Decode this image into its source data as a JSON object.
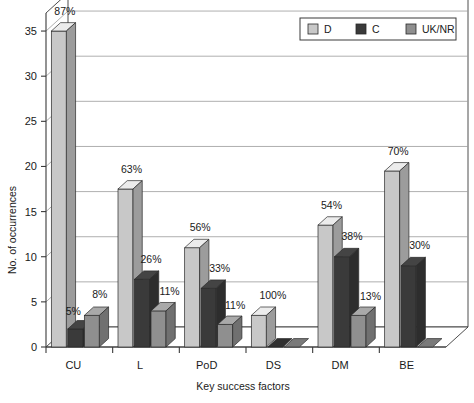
{
  "chart_data": {
    "type": "bar",
    "title": "",
    "subtitle": "",
    "xlabel": "Key success factors",
    "ylabel": "No. of occurrences",
    "categories": [
      "CU",
      "L",
      "PoD",
      "DS",
      "DM",
      "BE"
    ],
    "ylim": [
      0,
      37
    ],
    "yticks": [
      0,
      5,
      10,
      15,
      20,
      25,
      30,
      35
    ],
    "ytick_labels": [
      "0",
      "5",
      "10",
      "15",
      "20",
      "25",
      "30",
      "35"
    ],
    "grid": true,
    "grid_axis": "y",
    "legend_position": "top-right",
    "style": "3d-clustered-column",
    "series": [
      {
        "name": "D",
        "color": "#c8c8c8",
        "values": [
          35,
          17.5,
          11,
          3.5,
          13.5,
          19.5
        ],
        "labels": [
          "87%",
          "63%",
          "56%",
          "100%",
          "54%",
          "70%"
        ]
      },
      {
        "name": "C",
        "color": "#3a3a3a",
        "values": [
          2,
          7.5,
          6.5,
          0,
          10,
          9
        ],
        "labels": [
          "5%",
          "26%",
          "33%",
          "",
          "38%",
          "30%"
        ]
      },
      {
        "name": "UK/NR",
        "color": "#8f8f8f",
        "values": [
          3.5,
          4,
          2.5,
          0,
          3.5,
          0
        ],
        "labels": [
          "8%",
          "11%",
          "11%",
          "",
          "13%",
          ""
        ]
      }
    ],
    "annotations": [
      {
        "category": "CU",
        "series": "D",
        "text": "87%"
      },
      {
        "category": "CU",
        "series": "C",
        "text": "5%"
      },
      {
        "category": "CU",
        "series": "UK/NR",
        "text": "8%"
      },
      {
        "category": "L",
        "series": "D",
        "text": "63%"
      },
      {
        "category": "L",
        "series": "C",
        "text": "26%"
      },
      {
        "category": "L",
        "series": "UK/NR",
        "text": "11%"
      },
      {
        "category": "PoD",
        "series": "D",
        "text": "56%"
      },
      {
        "category": "PoD",
        "series": "C",
        "text": "33%"
      },
      {
        "category": "PoD",
        "series": "UK/NR",
        "text": "11%"
      },
      {
        "category": "DS",
        "series": "UK/NR",
        "text": "11%"
      },
      {
        "category": "DS",
        "series": "D",
        "text": "100%"
      },
      {
        "category": "DM",
        "series": "D",
        "text": "54%"
      },
      {
        "category": "DM",
        "series": "C",
        "text": "38%"
      },
      {
        "category": "DM",
        "series": "UK/NR",
        "text": "13%"
      },
      {
        "category": "BE",
        "series": "D",
        "text": "70%"
      },
      {
        "category": "BE",
        "series": "C",
        "text": "30%"
      }
    ]
  },
  "legend": {
    "items": [
      {
        "label": "D",
        "swatch": "#c8c8c8"
      },
      {
        "label": "C",
        "swatch": "#3a3a3a"
      },
      {
        "label": "UK/NR",
        "swatch": "#8f8f8f"
      }
    ]
  },
  "axes": {
    "y_title": "No. of occurrences",
    "x_title": "Key success factors",
    "y_ticks": [
      "35",
      "30",
      "25",
      "20",
      "15",
      "10",
      "5",
      "0"
    ],
    "x_ticks": [
      "CU",
      "L",
      "PoD",
      "DS",
      "DM",
      "BE"
    ]
  },
  "colors": {
    "series_d": "#c8c8c8",
    "series_c": "#3a3a3a",
    "series_uknr": "#8f8f8f",
    "grid": "#9a9a9a",
    "axis": "#3a3a3a",
    "background": "#ffffff"
  }
}
